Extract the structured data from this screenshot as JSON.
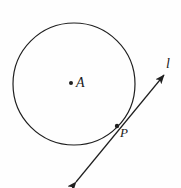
{
  "figure": {
    "kind": "geometry-diagram",
    "background_color": "#fefefe",
    "stroke_color": "#1f1f1f",
    "labels": {
      "center_label": "A",
      "tangent_point_label": "P",
      "line_label": "l"
    },
    "elements": {
      "circle": {
        "name": "circle",
        "center_x": 74,
        "center_y": 84,
        "radius": 61,
        "stroke_width": 1.2
      },
      "center_point": {
        "name": "center-point-A",
        "x": 71,
        "y": 83,
        "radius": 2.0
      },
      "tangent_point": {
        "name": "tangent-point-P",
        "x": 117,
        "y": 126,
        "radius": 2.2
      },
      "tangent_line": {
        "name": "tangent-line-l",
        "x1": 76,
        "y1": 182,
        "x2": 164,
        "y2": 75,
        "stroke_width": 1.2,
        "arrowheads": "both"
      }
    }
  }
}
